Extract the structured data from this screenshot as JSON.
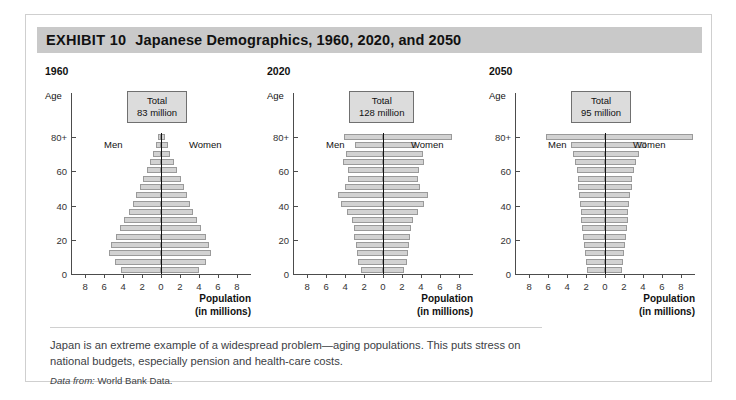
{
  "exhibit": {
    "label": "EXHIBIT 10",
    "title": "Japanese Demographics, 1960, 2020, and 2050"
  },
  "caption": "Japan is an extreme example of a widespread problem—aging populations. This puts stress on national budgets, especially pension and health-care costs.",
  "source_prefix": "Data from:",
  "source_text": "World Bank Data.",
  "axis": {
    "age_label": "Age",
    "y_ticks": [
      "0",
      "20",
      "40",
      "60",
      "80+"
    ],
    "x_ticks": [
      "8",
      "6",
      "4",
      "2",
      "0",
      "2",
      "4",
      "6",
      "8"
    ],
    "x_title_line1": "Population",
    "x_title_line2": "(in millions)",
    "men_label": "Men",
    "women_label": "Women",
    "total_label": "Total"
  },
  "colors": {
    "band": "#c9c9c9",
    "bar_fill": "#d2d2d2",
    "bar_stroke": "#9a9a9a",
    "axis": "#4c4c4c",
    "center": "#111111",
    "total_box": "#dcdcdc",
    "card_border": "#cfcfcf"
  },
  "chart_data": [
    {
      "type": "bar",
      "title": "1960",
      "subtitle": "Total 83 million",
      "total_value": "83 million",
      "xlabel": "Population (in millions)",
      "ylabel": "Age",
      "xlim": [
        -9.5,
        9.5
      ],
      "ylim": [
        0,
        85
      ],
      "grid": false,
      "legend": [
        "Men",
        "Women"
      ],
      "categories": [
        "0-4",
        "5-9",
        "10-14",
        "15-19",
        "20-24",
        "25-29",
        "30-34",
        "35-39",
        "40-44",
        "45-49",
        "50-54",
        "55-59",
        "60-64",
        "65-69",
        "70-74",
        "75-79",
        "80+"
      ],
      "series": [
        {
          "name": "Men",
          "values": [
            4.2,
            4.9,
            5.5,
            5.3,
            4.8,
            4.3,
            3.9,
            3.4,
            3.0,
            2.6,
            2.2,
            1.9,
            1.5,
            1.2,
            0.8,
            0.5,
            0.3
          ]
        },
        {
          "name": "Women",
          "values": [
            4.0,
            4.7,
            5.3,
            5.1,
            4.7,
            4.2,
            3.8,
            3.4,
            3.1,
            2.7,
            2.4,
            2.1,
            1.7,
            1.4,
            1.0,
            0.7,
            0.4
          ]
        }
      ]
    },
    {
      "type": "bar",
      "title": "2020",
      "subtitle": "Total 128 million",
      "total_value": "128 million",
      "xlabel": "Population (in millions)",
      "ylabel": "Age",
      "xlim": [
        -9.5,
        9.5
      ],
      "ylim": [
        0,
        85
      ],
      "grid": false,
      "legend": [
        "Men",
        "Women"
      ],
      "categories": [
        "0-4",
        "5-9",
        "10-14",
        "15-19",
        "20-24",
        "25-29",
        "30-34",
        "35-39",
        "40-44",
        "45-49",
        "50-54",
        "55-59",
        "60-64",
        "65-69",
        "70-74",
        "75-79",
        "80+"
      ],
      "series": [
        {
          "name": "Men",
          "values": [
            2.3,
            2.6,
            2.7,
            2.8,
            3.1,
            3.1,
            3.3,
            3.8,
            4.4,
            4.8,
            4.0,
            3.7,
            3.7,
            4.2,
            3.9,
            3.0,
            4.1
          ]
        },
        {
          "name": "Women",
          "values": [
            2.2,
            2.5,
            2.6,
            2.7,
            2.9,
            3.0,
            3.2,
            3.7,
            4.3,
            4.7,
            3.9,
            3.7,
            3.8,
            4.3,
            4.2,
            3.5,
            7.3
          ]
        }
      ]
    },
    {
      "type": "bar",
      "title": "2050",
      "subtitle": "Total 95 million",
      "total_value": "95 million",
      "xlabel": "Population (in millions)",
      "ylabel": "Age",
      "xlim": [
        -9.5,
        9.5
      ],
      "ylim": [
        0,
        85
      ],
      "grid": false,
      "legend": [
        "Men",
        "Women"
      ],
      "categories": [
        "0-4",
        "5-9",
        "10-14",
        "15-19",
        "20-24",
        "25-29",
        "30-34",
        "35-39",
        "40-44",
        "45-49",
        "50-54",
        "55-59",
        "60-64",
        "65-69",
        "70-74",
        "75-79",
        "80+"
      ],
      "series": [
        {
          "name": "Men",
          "values": [
            1.9,
            2.0,
            2.1,
            2.2,
            2.3,
            2.4,
            2.5,
            2.5,
            2.6,
            2.7,
            2.8,
            2.9,
            3.0,
            3.2,
            3.4,
            3.6,
            6.2
          ]
        },
        {
          "name": "Women",
          "values": [
            1.8,
            1.9,
            2.0,
            2.1,
            2.2,
            2.3,
            2.4,
            2.4,
            2.5,
            2.6,
            2.8,
            2.9,
            3.1,
            3.3,
            3.6,
            4.3,
            9.3
          ]
        }
      ]
    }
  ]
}
